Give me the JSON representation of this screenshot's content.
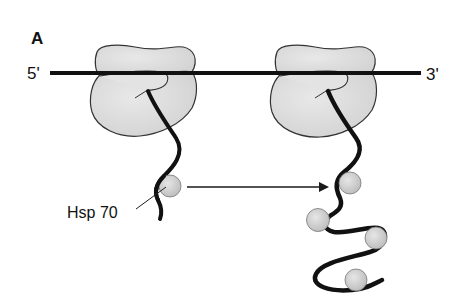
{
  "figure": {
    "panel_label": "A",
    "mrna": {
      "five_prime_label": "5'",
      "three_prime_label": "3'"
    },
    "chaperone_label": "Hsp 70",
    "elements": {
      "ribosomes": 2,
      "hsp70_on_left_chain": 1,
      "hsp70_on_right_chain": 4,
      "arrow": "left-to-right, from single Hsp70 chain to multi-Hsp70 chain"
    },
    "colors": {
      "ribosome_fill": "#dcdcdc",
      "hsp70_fill": "#cfcfcf",
      "line": "#1a1a1a"
    }
  }
}
